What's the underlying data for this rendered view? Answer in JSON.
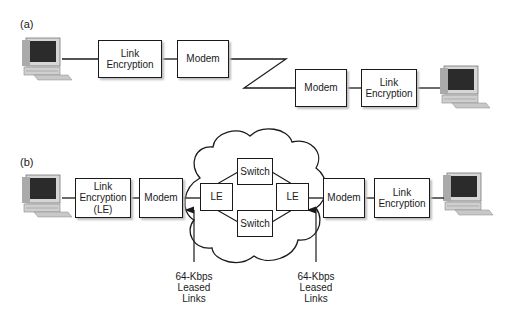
{
  "diagram": {
    "panel_a": {
      "label": "(a)",
      "left_link_encryption": [
        "Link",
        "Encryption"
      ],
      "left_modem": "Modem",
      "right_modem": "Modem",
      "right_link_encryption": [
        "Link",
        "Encryption"
      ]
    },
    "panel_b": {
      "label": "(b)",
      "left_link_encryption": [
        "Link",
        "Encryption",
        "(LE)"
      ],
      "left_modem": "Modem",
      "cloud": {
        "left_le": "LE",
        "right_le": "LE",
        "top_switch": "Switch",
        "bottom_switch": "Switch"
      },
      "right_modem": "Modem",
      "right_link_encryption": [
        "Link",
        "Encryption"
      ],
      "annotations": [
        [
          "64-Kbps",
          "Leased",
          "Links"
        ],
        [
          "64-Kbps",
          "Leased",
          "Links"
        ]
      ]
    },
    "icons": [
      "computer-icon",
      "computer-icon",
      "computer-icon",
      "computer-icon"
    ],
    "colors": {
      "line": "#1a1a1a",
      "shadow": "#bdbdbd",
      "screen": "#2a2a2a",
      "case": "#d8d8d8"
    }
  }
}
